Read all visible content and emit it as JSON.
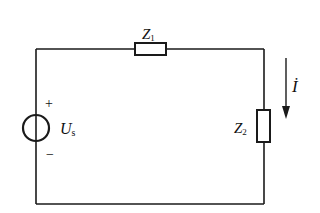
{
  "diagram": {
    "type": "circuit",
    "colors": {
      "line": "#1a1a1a",
      "background": "#ffffff"
    },
    "components": {
      "source": {
        "label_main": "U",
        "label_sub": "s",
        "plus": "+",
        "minus": "−"
      },
      "z1": {
        "label_main": "Z",
        "label_sub": "1"
      },
      "z2": {
        "label_main": "Z",
        "label_sub": "2"
      },
      "current": {
        "label": "İ",
        "direction": "down"
      }
    }
  }
}
